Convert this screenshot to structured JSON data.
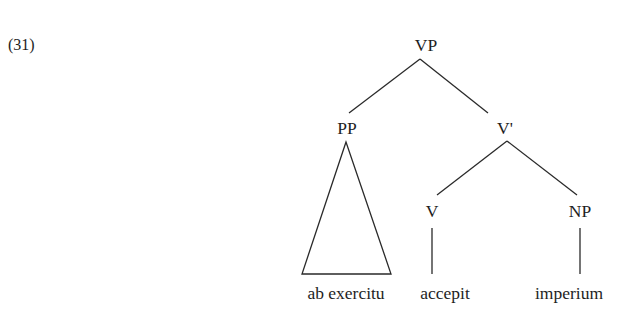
{
  "example": {
    "number": "(31)"
  },
  "tree": {
    "nodes": {
      "root": "VP",
      "pp": "PP",
      "vbar": "V'",
      "v": "V",
      "np": "NP"
    },
    "leaves": {
      "pp_leaf": "ab exercitu",
      "v_leaf": "accepit",
      "np_leaf": "imperium"
    },
    "structure": [
      {
        "parent": "VP",
        "children": [
          "PP",
          "V'"
        ]
      },
      {
        "parent": "PP",
        "children": [
          "ab exercitu"
        ],
        "triangle": true
      },
      {
        "parent": "V'",
        "children": [
          "V",
          "NP"
        ]
      },
      {
        "parent": "V",
        "children": [
          "accepit"
        ]
      },
      {
        "parent": "NP",
        "children": [
          "imperium"
        ]
      }
    ]
  }
}
